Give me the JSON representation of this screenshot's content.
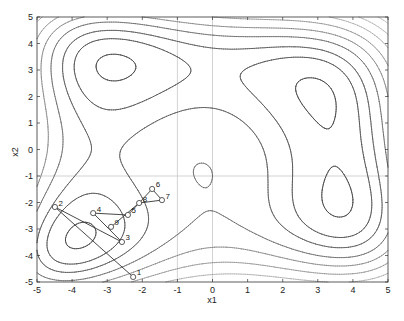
{
  "chart_data": {
    "type": "contour",
    "title": "",
    "function": "Himmelblau: (x1^2 + x2 - 11)^2 + (x1 + x2^2 - 7)^2",
    "xlabel": "x1",
    "ylabel": "x2",
    "xlim": [
      -5,
      5
    ],
    "ylim": [
      -5,
      5
    ],
    "xticks": [
      -5,
      -4,
      -3,
      -2,
      -1,
      0,
      1,
      2,
      3,
      4,
      5
    ],
    "yticks": [
      -5,
      -4,
      -3,
      -2,
      -1,
      0,
      1,
      2,
      3,
      4,
      5
    ],
    "grid_lines": {
      "x": [
        -1,
        0
      ],
      "y": [
        -1
      ]
    },
    "contour_levels": [
      {
        "level": 10,
        "color": "#444444",
        "width": 0.9
      },
      {
        "level": 60,
        "color": "#555555",
        "width": 0.9
      },
      {
        "level": 110,
        "color": "#5c5c5c",
        "width": 0.9
      },
      {
        "level": 180,
        "color": "#666666",
        "width": 0.8
      },
      {
        "level": 260,
        "color": "#777777",
        "width": 0.7
      },
      {
        "level": 360,
        "color": "#888888",
        "width": 0.7
      },
      {
        "level": 480,
        "color": "#999999",
        "width": 0.6
      },
      {
        "level": 620,
        "color": "#a4a4a4",
        "width": 0.6
      },
      {
        "level": 780,
        "color": "#aeaeae",
        "width": 0.55
      },
      {
        "level": 960,
        "color": "#b6b6b6",
        "width": 0.55
      },
      {
        "level": 1160,
        "color": "#bcbcbc",
        "width": 0.5
      },
      {
        "level": 1380,
        "color": "#c2c2c2",
        "width": 0.5
      },
      {
        "level": 1620,
        "color": "#c8c8c8",
        "width": 0.5
      },
      {
        "level": 1880,
        "color": "#cccccc",
        "width": 0.5
      }
    ],
    "path": {
      "name": "optimization iterates",
      "points": [
        {
          "label": "1",
          "x1": -2.26,
          "x2": -4.81
        },
        {
          "label": "2",
          "x1": -4.49,
          "x2": -2.17
        },
        {
          "label": "3",
          "x1": -2.58,
          "x2": -3.49
        },
        {
          "label": "4",
          "x1": -3.4,
          "x2": -2.4
        },
        {
          "label": "5",
          "x1": -2.41,
          "x2": -2.47
        },
        {
          "label": "6",
          "x1": -1.72,
          "x2": -1.49
        },
        {
          "label": "7",
          "x1": -1.44,
          "x2": -1.91
        },
        {
          "label": "8",
          "x1": -2.09,
          "x2": -2.02
        },
        {
          "label": "9",
          "x1": -2.89,
          "x2": -2.92
        }
      ],
      "marker": "open-circle",
      "line_color": "#333333"
    },
    "colors": {
      "axes": "#333333",
      "grid": "#c8c8c8",
      "background": "#ffffff"
    }
  }
}
